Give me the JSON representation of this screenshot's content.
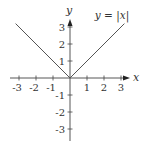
{
  "chart_data": {
    "type": "line",
    "title": "",
    "annotation": "y = |x|",
    "xlabel": "x",
    "ylabel": "y",
    "xlim": [
      -3.2,
      3.4
    ],
    "ylim": [
      -3.4,
      3.4
    ],
    "grid": false,
    "legend": null,
    "x_ticks": [
      -3,
      -2,
      -1,
      1,
      2,
      3
    ],
    "x_tick_labels": [
      "-3",
      "-2",
      "-1",
      "1",
      "2",
      "3"
    ],
    "y_ticks": [
      3,
      2,
      1,
      -1,
      -2,
      -3
    ],
    "y_tick_labels": [
      "3",
      "2",
      "1",
      "-1",
      "-2",
      "-3"
    ],
    "series": [
      {
        "name": "y = |x|",
        "x": [
          -3.2,
          -3,
          -2,
          -1,
          0,
          1,
          2,
          3,
          3.2
        ],
        "y": [
          3.2,
          3,
          2,
          1,
          0,
          1,
          2,
          3,
          3.2
        ]
      }
    ],
    "colors": {
      "line": "#555555",
      "axis": "#444444",
      "text": "#333333"
    }
  }
}
